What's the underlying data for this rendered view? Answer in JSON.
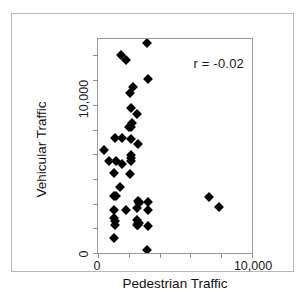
{
  "chart_data": {
    "type": "scatter",
    "title": "",
    "xlabel": "Pedestrian Traffic",
    "ylabel": "Vehicular Traffic",
    "xlim": [
      0,
      10000
    ],
    "ylim": [
      0,
      17333
    ],
    "xticks": [
      0,
      2000,
      4000,
      6000,
      8000,
      10000
    ],
    "yticks": [
      0,
      2000,
      4000,
      6000,
      8000,
      10000,
      12000,
      14000,
      16000
    ],
    "xticklabels": [
      "0",
      "",
      "",
      "",
      "",
      "10,000"
    ],
    "yticklabels": [
      "0",
      "",
      "",
      "",
      "",
      "10,000",
      "",
      "",
      ""
    ],
    "xticklabel_visible": {
      "min": "0",
      "max": "10,000"
    },
    "yticklabel_visible": {
      "min": "0",
      "mid": "10,000"
    },
    "grid": false,
    "legend": false,
    "marker": "diamond",
    "marker_color": "#000000",
    "marker_size_px": 7,
    "annotations": [
      {
        "name": "correlation",
        "text": "r = -0.02",
        "x_frac": 0.72,
        "y_frac": 0.9
      }
    ],
    "correlation": -0.02,
    "n_points": 48,
    "points": [
      {
        "x": 3205,
        "y": 17000
      },
      {
        "x": 1475,
        "y": 16000
      },
      {
        "x": 1795,
        "y": 15600
      },
      {
        "x": 3270,
        "y": 14100
      },
      {
        "x": 2245,
        "y": 13420
      },
      {
        "x": 2050,
        "y": 12940
      },
      {
        "x": 2115,
        "y": 11780
      },
      {
        "x": 2500,
        "y": 11240
      },
      {
        "x": 2180,
        "y": 10520
      },
      {
        "x": 2115,
        "y": 10180
      },
      {
        "x": 1990,
        "y": 10180
      },
      {
        "x": 1090,
        "y": 9280
      },
      {
        "x": 1540,
        "y": 9280
      },
      {
        "x": 2115,
        "y": 9270
      },
      {
        "x": 2565,
        "y": 8840
      },
      {
        "x": 385,
        "y": 8370
      },
      {
        "x": 2115,
        "y": 7930
      },
      {
        "x": 2115,
        "y": 7660
      },
      {
        "x": 705,
        "y": 7480
      },
      {
        "x": 1155,
        "y": 7480
      },
      {
        "x": 2115,
        "y": 7430
      },
      {
        "x": 1540,
        "y": 7210
      },
      {
        "x": 1025,
        "y": 6500
      },
      {
        "x": 2050,
        "y": 6400
      },
      {
        "x": 1410,
        "y": 5320
      },
      {
        "x": 1025,
        "y": 4610
      },
      {
        "x": 1155,
        "y": 4600
      },
      {
        "x": 7180,
        "y": 4510
      },
      {
        "x": 2565,
        "y": 4240
      },
      {
        "x": 2630,
        "y": 4150
      },
      {
        "x": 2690,
        "y": 4080
      },
      {
        "x": 3270,
        "y": 4150
      },
      {
        "x": 7885,
        "y": 3700
      },
      {
        "x": 1025,
        "y": 3520
      },
      {
        "x": 1795,
        "y": 3520
      },
      {
        "x": 2500,
        "y": 3630
      },
      {
        "x": 3270,
        "y": 3470
      },
      {
        "x": 1025,
        "y": 2850
      },
      {
        "x": 1090,
        "y": 2600
      },
      {
        "x": 2500,
        "y": 2700
      },
      {
        "x": 2565,
        "y": 2450
      },
      {
        "x": 2630,
        "y": 2400
      },
      {
        "x": 1090,
        "y": 2300
      },
      {
        "x": 3270,
        "y": 2200
      },
      {
        "x": 1025,
        "y": 1200
      },
      {
        "x": 2500,
        "y": 2300
      },
      {
        "x": 3205,
        "y": 230
      },
      {
        "x": 2565,
        "y": 2250
      }
    ]
  }
}
